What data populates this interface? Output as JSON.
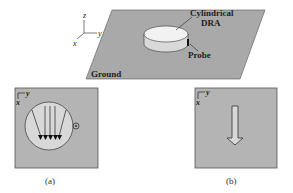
{
  "figure": {
    "top": {
      "labels": {
        "dra": [
          "Cylindrical",
          "DRA"
        ],
        "probe": "Probe",
        "ground": "Ground"
      },
      "axes": {
        "z": "z",
        "y": "y",
        "x": "x"
      }
    },
    "panel_a": {
      "caption": "(a)",
      "axes": {
        "y": "y",
        "x": "x"
      }
    },
    "panel_b": {
      "caption": "(b)",
      "axes": {
        "y": "y",
        "x": "x"
      }
    },
    "colors": {
      "ground": "#a9a9a9",
      "panel": "#b4b4b4",
      "dra_top": "#f2f2f2",
      "dra_side": "#d9d9d9",
      "ink": "#222222"
    }
  }
}
